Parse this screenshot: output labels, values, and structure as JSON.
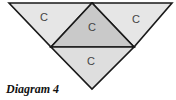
{
  "diagram": {
    "caption": "Diagram 4",
    "colors": {
      "outer_fill": "#e6e6e6",
      "center_fill": "#c9c9c9",
      "bottom_fill": "#dedede",
      "stroke": "#1a1a1a",
      "label": "#444444"
    },
    "regions": [
      {
        "name": "left-triangle",
        "label": "C"
      },
      {
        "name": "center-triangle",
        "label": "C"
      },
      {
        "name": "right-triangle",
        "label": "C"
      },
      {
        "name": "bottom-triangle",
        "label": "C"
      }
    ]
  }
}
